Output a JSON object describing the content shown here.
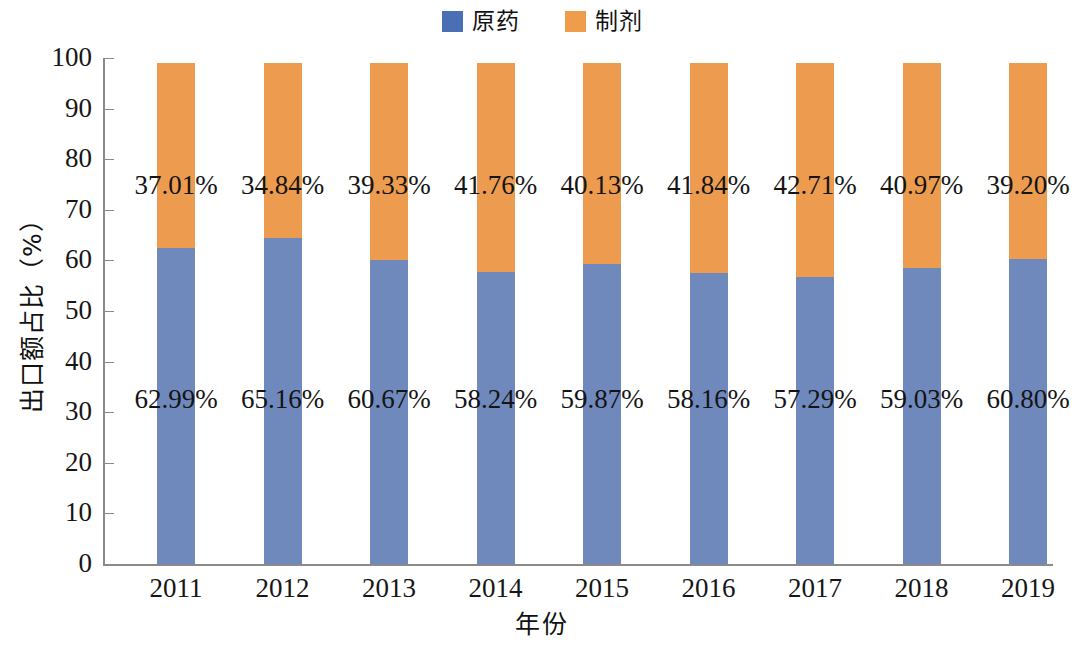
{
  "chart_data": {
    "type": "bar",
    "subtype": "stacked-bar-100",
    "title": "",
    "xlabel": "年份",
    "ylabel": "出口额占比（%）",
    "ylim": [
      0,
      100
    ],
    "ytick_step": 10,
    "yticks": [
      "100",
      "90",
      "80",
      "70",
      "60",
      "50",
      "40",
      "30",
      "20",
      "10",
      "0"
    ],
    "grid": false,
    "legend_position": "top-center",
    "bar_total": 99.0,
    "categories": [
      "2011",
      "2012",
      "2013",
      "2014",
      "2015",
      "2016",
      "2017",
      "2018",
      "2019"
    ],
    "series": [
      {
        "name": "原药",
        "color": "#7089bd",
        "legend_color": "#4a6fb5",
        "stack_position": "bottom",
        "values": [
          62.99,
          65.16,
          60.67,
          58.24,
          59.87,
          58.16,
          57.29,
          59.03,
          60.8
        ],
        "labels": [
          "62.99%",
          "65.16%",
          "60.67%",
          "58.24%",
          "59.87%",
          "58.16%",
          "57.29%",
          "59.03%",
          "60.80%"
        ]
      },
      {
        "name": "制剂",
        "color": "#ed9c4f",
        "legend_color": "#ef9c4c",
        "stack_position": "top",
        "values": [
          37.01,
          34.84,
          39.33,
          41.76,
          40.13,
          41.84,
          42.71,
          40.97,
          39.2
        ],
        "labels": [
          "37.01%",
          "34.84%",
          "39.33%",
          "41.76%",
          "40.13%",
          "41.84%",
          "42.71%",
          "40.97%",
          "39.20%"
        ]
      }
    ]
  },
  "legend": {
    "entries": [
      {
        "label": "原药",
        "color": "#4a6fb5"
      },
      {
        "label": "制剂",
        "color": "#ef9c4c"
      }
    ]
  },
  "axes": {
    "y_title": "出口额占比（%）",
    "x_title": "年份"
  }
}
